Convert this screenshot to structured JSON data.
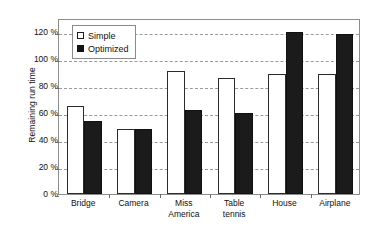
{
  "chart_data": {
    "type": "bar",
    "title": "",
    "xlabel": "",
    "ylabel": "Remaining run time",
    "categories": [
      "Bridge",
      "Camera",
      "Miss America",
      "Table tennis",
      "House",
      "Airplane"
    ],
    "category_lines": [
      [
        "Bridge"
      ],
      [
        "Camera"
      ],
      [
        "Miss",
        "America"
      ],
      [
        "Table",
        "tennis"
      ],
      [
        "House"
      ],
      [
        "Airplane"
      ]
    ],
    "series": [
      {
        "name": "Simple",
        "color": "#ffffff",
        "values": [
          65,
          48,
          91,
          86,
          89,
          89
        ]
      },
      {
        "name": "Optimized",
        "color": "#1b1b1b",
        "values": [
          54,
          48,
          62,
          60,
          120,
          118
        ]
      }
    ],
    "ylim": [
      0,
      130
    ],
    "yticks": [
      0,
      20,
      40,
      60,
      80,
      100,
      120
    ],
    "ytick_labels": [
      "0 %",
      "20 %",
      "40 %",
      "60 %",
      "80 %",
      "100 %",
      "120 %"
    ],
    "grid": true,
    "grid_axis": "y",
    "legend_position": "top-left",
    "unit": "%"
  },
  "legend": {
    "entries": [
      {
        "label": "Simple",
        "swatch": "open-square-icon"
      },
      {
        "label": "Optimized",
        "swatch": "filled-square-icon"
      }
    ]
  }
}
